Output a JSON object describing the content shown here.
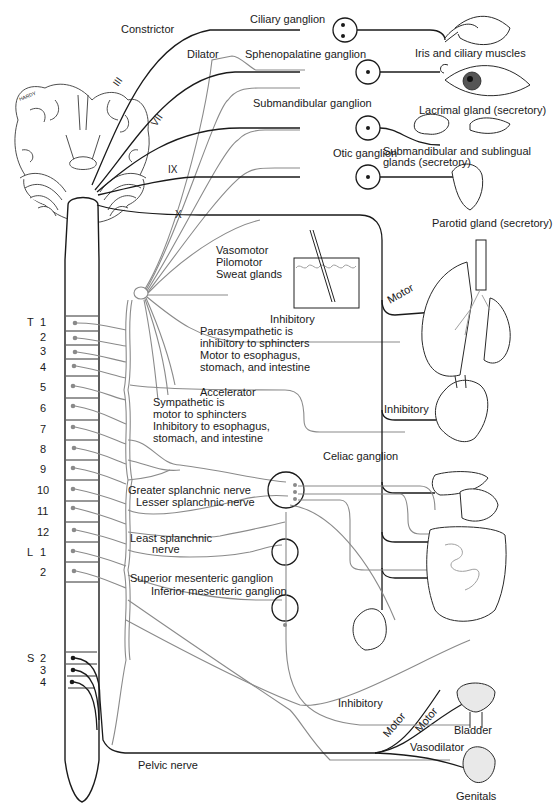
{
  "cranial_nerves": {
    "III": "III",
    "VII": "VII",
    "IX": "IX",
    "X": "X"
  },
  "eye_labels": {
    "constrictor": "Constrictor",
    "dilator": "Dilator",
    "ciliary_ganglion": "Ciliary ganglion",
    "iris": "Iris and ciliary muscles"
  },
  "head_labels": {
    "sphenopalatine": "Sphenopalatine ganglion",
    "lacrimal": "Lacrimal gland (secretory)",
    "submandibular_ganglion": "Submandibular ganglion",
    "submandibular_glands_1": "Submandibular and sublingual",
    "submandibular_glands_2": "glands (secretory)",
    "otic": "Otic ganglion",
    "parotid": "Parotid gland (secretory)"
  },
  "skin_labels": {
    "line1": "Vasomotor",
    "line2": "Pilomotor",
    "line3": "Sweat glands"
  },
  "thorax_labels": {
    "motor": "Motor",
    "inhibitory_lung": "Inhibitory",
    "para_1": "Parasympathetic is",
    "para_2": "inhibitory to sphincters",
    "para_3": "Motor to esophagus,",
    "para_4": "stomach, and intestine",
    "accelerator": "Accelerator",
    "inhibitory_heart": "Inhibitory",
    "symp_1": "Sympathetic is",
    "symp_2": "motor to sphincters",
    "symp_3": "Inhibitory to esophagus,",
    "symp_4": "stomach, and intestine"
  },
  "abdomen_labels": {
    "celiac": "Celiac ganglion",
    "greater": "Greater splanchnic nerve",
    "lesser": "Lesser splanchnic nerve",
    "least_1": "Least splanchnic",
    "least_2": "nerve",
    "superior": "Superior mesenteric ganglion",
    "inferior": "Inferior mesenteric ganglion"
  },
  "pelvic_labels": {
    "inhibitory": "Inhibitory",
    "motor_1": "Motor",
    "motor_2": "Motor",
    "bladder": "Bladder",
    "vasodilator": "Vasodilator",
    "genitals": "Genitals",
    "pelvic_nerve": "Pelvic nerve"
  },
  "spinal_segments": {
    "T": "T",
    "L": "L",
    "S": "S",
    "thoracic": [
      "1",
      "2",
      "3",
      "4",
      "5",
      "6",
      "7",
      "8",
      "9",
      "10",
      "11",
      "12"
    ],
    "lumbar": [
      "1",
      "2"
    ],
    "sacral": [
      "2",
      "3",
      "4"
    ]
  },
  "signature": "HARDY",
  "colors": {
    "parasympathetic": "#1a1a1a",
    "sympathetic": "#8a8a8a",
    "background": "#ffffff"
  }
}
